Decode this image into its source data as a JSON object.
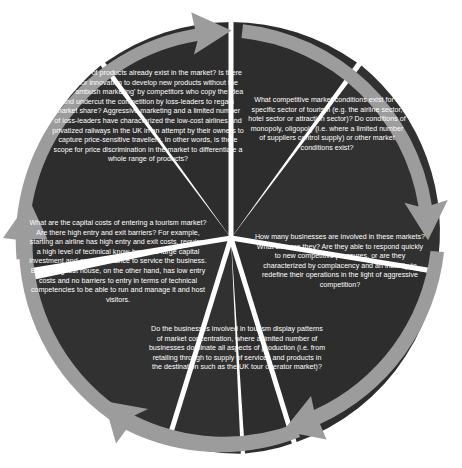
{
  "diagram": {
    "shape": "pentagon-segmented-circle",
    "colors": {
      "segment_fill": "#2e2d2d",
      "segment_fill_alt": "#323131",
      "arrow_gray": "#9c9c9c",
      "arrow_gray_dark": "#8b8b8b",
      "divider": "#ffffff",
      "text": "#ffffff",
      "background": "#ffffff"
    },
    "arrow_count": 5,
    "arrow_direction": "clockwise",
    "segments": [
      {
        "id": "products",
        "position": "top",
        "text": "What types of products already exist in the market? Is there scope for innovation to develop new products without the risk of 'ambush marketing' by competitors who copy the idea and undercut the competition by loss-leaders to regain market share? Aggressive marketing and a limited number of loss-leaders have characterized the low-cost airlines and privatized railways in the UK in an attempt by their owners to capture price-sensitive travellers. In other words, is there scope for price discrimination in the market to differentiate a whole range of products?"
      },
      {
        "id": "conditions",
        "position": "right",
        "text": "What competitive market conditions exist for a specific sector of tourism (e.g. the airline sector, hotel sector or attraction sector)? Do conditions of monopoly, oligopoly (i.e. where a limited number of suppliers control supply) or other market conditions exist?"
      },
      {
        "id": "businesses",
        "position": "lower-right",
        "text": "How many businesses are involved in these markets? What size are they? Are they able to respond quickly to new competitive pressures, or are they characterized by complacency and an inability to redefine their operations in the light of aggressive competition?"
      },
      {
        "id": "concentration",
        "position": "bottom",
        "text": "Do the businesses involved in tourism display patterns of market concentration, where a limited number of businesses dominate all aspects of production (i.e. from retailing through to supply of services and products in the destination such as the UK tour operator market)?"
      },
      {
        "id": "capital",
        "position": "left",
        "text": "What are the capital costs of entering a tourism market? Are there high entry and exit barriers? For example, starting an airline has high entry and exit costs, requires a high level of technical know-how and large capital investment and ongoing finance to service the business. Buying a guest house, on the other hand, has low entry costs and no barriers to entry in terms of technical competencies to be able to run and manage it and host visitors."
      }
    ]
  }
}
